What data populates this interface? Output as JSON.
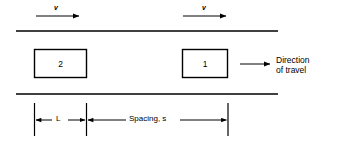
{
  "figure": {
    "background_color": "#ffffff",
    "line_color": "#000000",
    "roadway": {
      "top_edge_label": "roadway-top-edge",
      "bottom_edge_label": "roadway-bottom-edge"
    },
    "speed_arrows": [
      {
        "label": "v",
        "name": "speed-arrow-left"
      },
      {
        "label": "v",
        "name": "speed-arrow-right"
      }
    ],
    "vehicles": [
      {
        "label": "2",
        "name": "vehicle-box-2",
        "position": "rear"
      },
      {
        "label": "1",
        "name": "vehicle-box-1",
        "position": "lead"
      }
    ],
    "direction": {
      "line1": "Direction",
      "line2": "of travel",
      "arrow_name": "direction-of-travel-arrow"
    },
    "dimensions": [
      {
        "label": "L",
        "name": "dimension-length-L",
        "description": "vehicle length"
      },
      {
        "label": "Spacing, s",
        "name": "dimension-spacing-s",
        "description": "spacing between vehicles"
      }
    ]
  }
}
